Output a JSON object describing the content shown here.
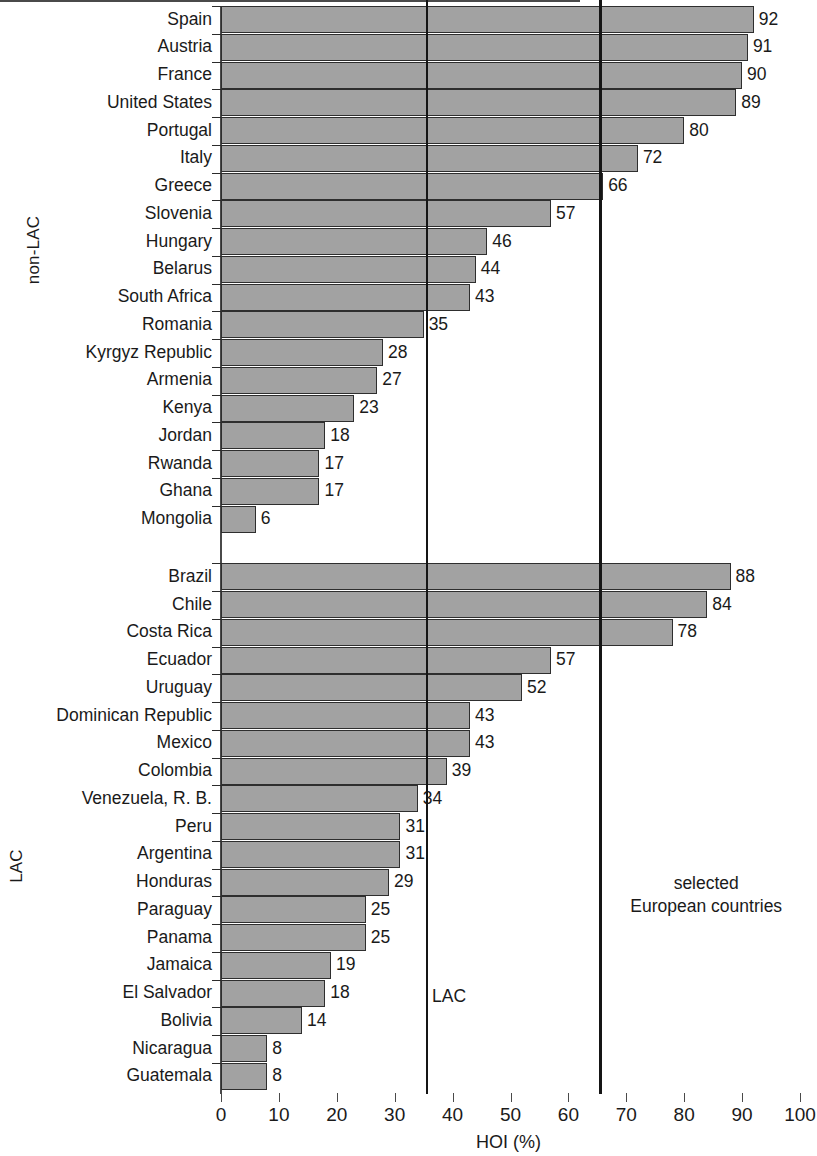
{
  "chart_data": {
    "type": "bar",
    "orientation": "horizontal",
    "title": "",
    "xlabel": "HOI (%)",
    "ylabel": "",
    "xlim": [
      0,
      100
    ],
    "xticks": [
      0,
      10,
      20,
      30,
      40,
      50,
      60,
      70,
      80,
      90,
      100
    ],
    "grid": false,
    "legend": null,
    "bar_color": "#a2a2a2",
    "bar_edge_color": "#2e2e2e",
    "groups": [
      {
        "name": "non-LAC",
        "categories": [
          "Spain",
          "Austria",
          "France",
          "United States",
          "Portugal",
          "Italy",
          "Greece",
          "Slovenia",
          "Hungary",
          "Belarus",
          "South Africa",
          "Romania",
          "Kyrgyz Republic",
          "Armenia",
          "Kenya",
          "Jordan",
          "Rwanda",
          "Ghana",
          "Mongolia"
        ],
        "values": [
          92,
          91,
          90,
          89,
          80,
          72,
          66,
          57,
          46,
          44,
          43,
          35,
          28,
          27,
          23,
          18,
          17,
          17,
          6
        ]
      },
      {
        "name": "LAC",
        "categories": [
          "Brazil",
          "Chile",
          "Costa Rica",
          "Ecuador",
          "Uruguay",
          "Dominican Republic",
          "Mexico",
          "Colombia",
          "Venezuela, R. B.",
          "Peru",
          "Argentina",
          "Honduras",
          "Paraguay",
          "Panama",
          "Jamaica",
          "El Salvador",
          "Bolivia",
          "Nicaragua",
          "Guatemala"
        ],
        "values": [
          88,
          84,
          78,
          57,
          52,
          43,
          43,
          39,
          34,
          31,
          31,
          29,
          25,
          25,
          19,
          18,
          14,
          8,
          8
        ]
      }
    ],
    "reference_lines": [
      {
        "label": "LAC",
        "value": 35.6,
        "color": "#151515"
      },
      {
        "label": "selected\nEuropean countries",
        "value": 65.5,
        "color": "#151515"
      }
    ],
    "annotations": [
      {
        "name": "lac-average-label",
        "text": "LAC"
      },
      {
        "name": "european-average-label-line1",
        "text": "selected"
      },
      {
        "name": "european-average-label-line2",
        "text": "European countries"
      }
    ]
  }
}
